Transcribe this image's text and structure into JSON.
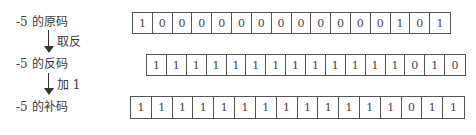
{
  "labels": {
    "original": "-5 的原码",
    "ones": "-5 的反码",
    "twos": "-5 的补码"
  },
  "operations": {
    "invert": "取反",
    "add_one": "加 1"
  },
  "rows": {
    "original": [
      "1",
      "0",
      "0",
      "0",
      "0",
      "0",
      "0",
      "0",
      "0",
      "0",
      "0",
      "0",
      "0",
      "1",
      "0",
      "1"
    ],
    "ones": [
      "1",
      "1",
      "1",
      "1",
      "1",
      "1",
      "1",
      "1",
      "1",
      "1",
      "1",
      "1",
      "1",
      "0",
      "1",
      "0"
    ],
    "twos": [
      "1",
      "1",
      "1",
      "1",
      "1",
      "1",
      "1",
      "1",
      "1",
      "1",
      "1",
      "1",
      "1",
      "0",
      "1",
      "1"
    ]
  }
}
